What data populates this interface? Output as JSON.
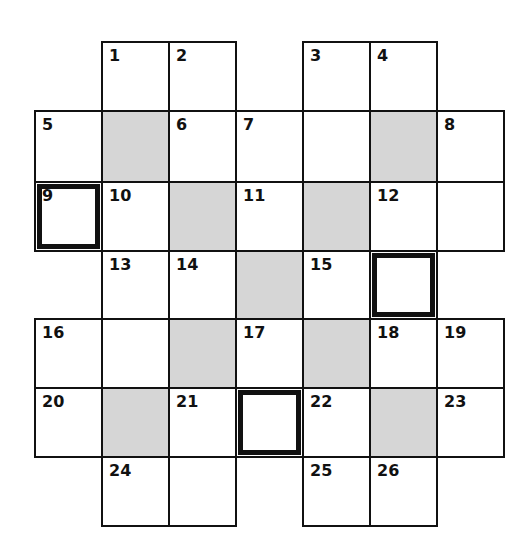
{
  "puzzle": {
    "type": "crossword",
    "rows": 7,
    "cols": 7,
    "colors": {
      "shaded": "#d6d6d6",
      "line": "#111111",
      "background": "#ffffff"
    },
    "cells": [
      {
        "r": 0,
        "c": 1,
        "num": "1"
      },
      {
        "r": 0,
        "c": 2,
        "num": "2"
      },
      {
        "r": 0,
        "c": 4,
        "num": "3"
      },
      {
        "r": 0,
        "c": 5,
        "num": "4"
      },
      {
        "r": 1,
        "c": 0,
        "num": "5"
      },
      {
        "r": 1,
        "c": 1,
        "shaded": true
      },
      {
        "r": 1,
        "c": 2,
        "num": "6"
      },
      {
        "r": 1,
        "c": 3,
        "num": "7"
      },
      {
        "r": 1,
        "c": 4
      },
      {
        "r": 1,
        "c": 5,
        "shaded": true
      },
      {
        "r": 1,
        "c": 6,
        "num": "8"
      },
      {
        "r": 2,
        "c": 0,
        "num": "9",
        "bold": true
      },
      {
        "r": 2,
        "c": 1,
        "num": "10"
      },
      {
        "r": 2,
        "c": 2,
        "shaded": true
      },
      {
        "r": 2,
        "c": 3,
        "num": "11"
      },
      {
        "r": 2,
        "c": 4,
        "shaded": true
      },
      {
        "r": 2,
        "c": 5,
        "num": "12"
      },
      {
        "r": 2,
        "c": 6
      },
      {
        "r": 3,
        "c": 1,
        "num": "13"
      },
      {
        "r": 3,
        "c": 2,
        "num": "14"
      },
      {
        "r": 3,
        "c": 3,
        "shaded": true
      },
      {
        "r": 3,
        "c": 4,
        "num": "15"
      },
      {
        "r": 3,
        "c": 5,
        "bold": true
      },
      {
        "r": 4,
        "c": 0,
        "num": "16"
      },
      {
        "r": 4,
        "c": 1
      },
      {
        "r": 4,
        "c": 2,
        "shaded": true
      },
      {
        "r": 4,
        "c": 3,
        "num": "17"
      },
      {
        "r": 4,
        "c": 4,
        "shaded": true
      },
      {
        "r": 4,
        "c": 5,
        "num": "18"
      },
      {
        "r": 4,
        "c": 6,
        "num": "19"
      },
      {
        "r": 5,
        "c": 0,
        "num": "20"
      },
      {
        "r": 5,
        "c": 1,
        "shaded": true
      },
      {
        "r": 5,
        "c": 2,
        "num": "21"
      },
      {
        "r": 5,
        "c": 3,
        "bold": true
      },
      {
        "r": 5,
        "c": 4,
        "num": "22"
      },
      {
        "r": 5,
        "c": 5,
        "shaded": true
      },
      {
        "r": 5,
        "c": 6,
        "num": "23"
      },
      {
        "r": 6,
        "c": 1,
        "num": "24"
      },
      {
        "r": 6,
        "c": 2
      },
      {
        "r": 6,
        "c": 4,
        "num": "25"
      },
      {
        "r": 6,
        "c": 5,
        "num": "26"
      }
    ]
  }
}
